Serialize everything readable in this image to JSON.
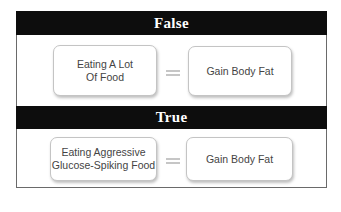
{
  "sections": [
    {
      "header": "False",
      "left_box": "Eating A Lot\nOf Food",
      "left_lines": [
        "Eating A Lot",
        "Of Food"
      ],
      "operator": "equals",
      "right_box": "Gain Body Fat"
    },
    {
      "header": "True",
      "left_box": "Eating Aggressive\nGlucose-Spiking Food",
      "left_lines": [
        "Eating Aggressive",
        "Glucose-Spiking Food"
      ],
      "operator": "equals",
      "right_box": "Gain Body Fat"
    }
  ],
  "colors": {
    "header_bg": "#0d0d0d",
    "header_text": "#ffffff",
    "box_border": "#c4c4c4",
    "equals": "#c6c6c6"
  }
}
